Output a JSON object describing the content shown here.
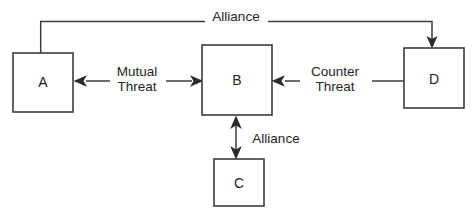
{
  "diagram": {
    "background_color": "#ffffff",
    "line_color": "#3b3b3f",
    "text_color": "#242428",
    "nodes": [
      {
        "id": "A",
        "label": "A",
        "x": 13,
        "y": 53,
        "w": 60,
        "h": 59
      },
      {
        "id": "B",
        "label": "B",
        "x": 202,
        "y": 45,
        "w": 70,
        "h": 70
      },
      {
        "id": "C",
        "label": "C",
        "x": 214,
        "y": 159,
        "w": 50,
        "h": 47
      },
      {
        "id": "D",
        "label": "D",
        "x": 404,
        "y": 48,
        "w": 60,
        "h": 60
      }
    ],
    "edges": [
      {
        "id": "alliance-a-d",
        "label": "Alliance",
        "from": "A",
        "to": "D",
        "arrowheads": "to",
        "label_x": 236,
        "label_y": 16
      },
      {
        "id": "mutual-threat-a-b",
        "label_line1": "Mutual",
        "label_line2": "Threat",
        "from": "A",
        "to": "B",
        "arrowheads": "both",
        "label_x": 137,
        "label_y": 77
      },
      {
        "id": "counter-threat-d-b",
        "label_line1": "Counter",
        "label_line2": "Threat",
        "from": "D",
        "to": "B",
        "arrowheads": "to",
        "label_x": 335,
        "label_y": 77
      },
      {
        "id": "alliance-b-c",
        "label": "Alliance",
        "from": "B",
        "to": "C",
        "arrowheads": "both",
        "label_x": 276,
        "label_y": 142
      }
    ]
  }
}
